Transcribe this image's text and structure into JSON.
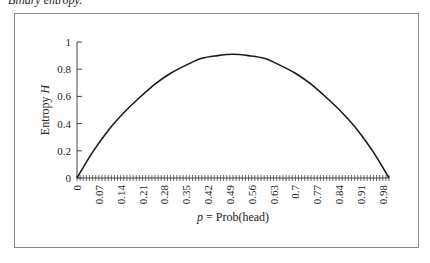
{
  "caption": "Binary entropy.",
  "chart_data": {
    "type": "line",
    "title": "Binary entropy.",
    "xlabel": "p = Prob(head)",
    "xlabel_italic": "p",
    "xlabel_rest": " = Prob(head)",
    "ylabel": "Entropy H",
    "ylabel_plain": "Entropy ",
    "ylabel_italic": "H",
    "ylim": [
      0,
      1
    ],
    "xlim": [
      0,
      1
    ],
    "y_ticks": [
      "0",
      "0.2",
      "0.4",
      "0.6",
      "0.8",
      "1"
    ],
    "x_tick_labels": [
      "0",
      "0.07",
      "0.14",
      "0.21",
      "0.28",
      "0.35",
      "0.42",
      "0.49",
      "0.56",
      "0.63",
      "0.7",
      "0.77",
      "0.84",
      "0.91",
      "0.98"
    ],
    "x_minor_tick_step": 0.01,
    "grid": false,
    "legend": null,
    "series": [
      {
        "name": "Entropy H",
        "color": "#1a1a1a",
        "x": [
          0,
          0.05,
          0.1,
          0.15,
          0.2,
          0.25,
          0.3,
          0.35,
          0.4,
          0.45,
          0.5,
          0.55,
          0.6,
          0.65,
          0.7,
          0.75,
          0.8,
          0.85,
          0.9,
          0.95,
          1.0
        ],
        "values": [
          0,
          0.19,
          0.35,
          0.48,
          0.59,
          0.69,
          0.77,
          0.83,
          0.88,
          0.9,
          0.91,
          0.9,
          0.88,
          0.83,
          0.77,
          0.69,
          0.59,
          0.48,
          0.35,
          0.19,
          0
        ]
      }
    ]
  }
}
